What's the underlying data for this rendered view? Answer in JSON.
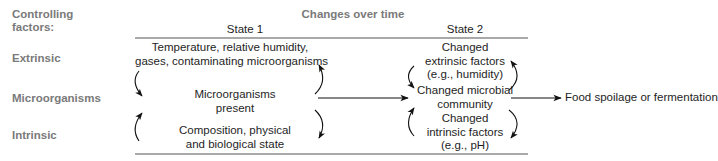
{
  "header": {
    "controlling_factors_line1": "Controlling",
    "controlling_factors_line2": "factors:",
    "changes_over_time": "Changes over time",
    "state1": "State 1",
    "state2": "State 2"
  },
  "row_labels": {
    "extrinsic": "Extrinsic",
    "microorganisms": "Microorganisms",
    "intrinsic": "Intrinsic"
  },
  "state1": {
    "extrinsic_line1": "Temperature, relative humidity,",
    "extrinsic_line2": "gases, contaminating microorganisms",
    "micro_line1": "Microorganisms",
    "micro_line2": "present",
    "intrinsic_line1": "Composition, physical",
    "intrinsic_line2": "and biological state"
  },
  "state2": {
    "extrinsic_line1": "Changed",
    "extrinsic_line2": "extrinsic factors",
    "extrinsic_line3": "(e.g., humidity)",
    "micro_line1": "Changed microbial",
    "micro_line2": "community",
    "intrinsic_line1": "Changed",
    "intrinsic_line2": "intrinsic factors",
    "intrinsic_line3": "(e.g., pH)"
  },
  "outcome": {
    "label": "Food spoilage or fermentation"
  },
  "colors": {
    "label_gray": "#7a7a7a",
    "text": "#1e1e1e",
    "rule": "#555555",
    "arrow": "#111111"
  }
}
